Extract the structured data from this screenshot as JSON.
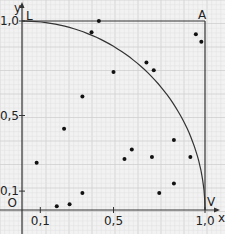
{
  "chart_data": {
    "type": "scatter",
    "title": "",
    "xlabel": "x",
    "ylabel": "y",
    "xlim": [
      0,
      1.0
    ],
    "ylim": [
      0,
      1.0
    ],
    "grid": true,
    "x_ticks": [
      "0,1",
      "0,5",
      "1,0"
    ],
    "y_ticks": [
      "0,1",
      "0,5",
      "1,0"
    ],
    "origin_label": "O",
    "corner_labels": {
      "top_left": "L",
      "top_right": "A",
      "bottom_right": "V"
    },
    "curve": "quarter circle x^2 + y^2 = 1",
    "points": [
      [
        0.42,
        1.0
      ],
      [
        0.38,
        0.94
      ],
      [
        0.95,
        0.93
      ],
      [
        0.98,
        0.89
      ],
      [
        0.68,
        0.78
      ],
      [
        0.72,
        0.74
      ],
      [
        0.5,
        0.73
      ],
      [
        0.33,
        0.6
      ],
      [
        0.23,
        0.43
      ],
      [
        0.08,
        0.25
      ],
      [
        0.83,
        0.37
      ],
      [
        0.6,
        0.32
      ],
      [
        0.56,
        0.27
      ],
      [
        0.71,
        0.28
      ],
      [
        0.92,
        0.28
      ],
      [
        0.83,
        0.14
      ],
      [
        0.75,
        0.09
      ],
      [
        0.33,
        0.09
      ],
      [
        0.26,
        0.03
      ],
      [
        0.19,
        0.02
      ]
    ]
  }
}
